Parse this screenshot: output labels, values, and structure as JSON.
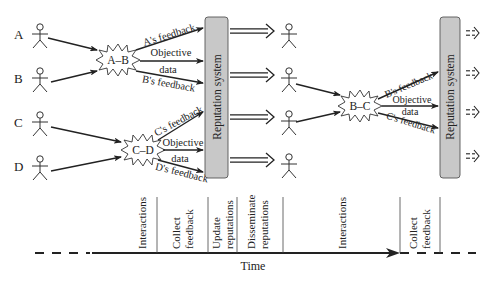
{
  "actors": {
    "left": [
      {
        "label": "A"
      },
      {
        "label": "B"
      },
      {
        "label": "C"
      },
      {
        "label": "D"
      }
    ]
  },
  "interactions": {
    "ab": {
      "burst_label": "A–B",
      "feedback_top": "A's feedback",
      "objective": "Objective",
      "data": "data",
      "feedback_bottom": "B's feedback"
    },
    "cd": {
      "burst_label": "C–D",
      "feedback_top": "C's feedback",
      "objective": "Objective",
      "data": "data",
      "feedback_bottom": "D's feedback"
    },
    "bc": {
      "burst_label": "B–C",
      "feedback_top": "B's feedback",
      "objective": "Objective",
      "data": "data",
      "feedback_bottom": "C's feedback"
    }
  },
  "reputation_system": {
    "first_label": "Reputation system",
    "second_label": "Reputation system",
    "fill_color": "#c8c8c8"
  },
  "timeline": {
    "axis_label": "Time",
    "phases": [
      {
        "label_line1": "Interactions",
        "label_line2": ""
      },
      {
        "label_line1": "Collect",
        "label_line2": "feedback"
      },
      {
        "label_line1": "Update",
        "label_line2": "reputations"
      },
      {
        "label_line1": "Disseminate",
        "label_line2": "reputations"
      },
      {
        "label_line1": "Interactions",
        "label_line2": ""
      },
      {
        "label_line1": "Collect",
        "label_line2": "feedback"
      }
    ]
  }
}
